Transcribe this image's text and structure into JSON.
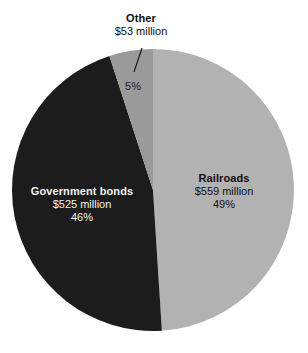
{
  "chart_data": {
    "type": "pie",
    "title": "",
    "subtitle": "",
    "xlabel": "",
    "ylabel": "",
    "legend_position": "none",
    "grid": false,
    "units": "million dollars",
    "total_value": 1137,
    "categories": [
      "Railroads",
      "Government bonds",
      "Other"
    ],
    "values": [
      559,
      525,
      53
    ],
    "percents": [
      49,
      46,
      5
    ],
    "slices": [
      {
        "name": "Railroads",
        "label": "Railroads",
        "value": 559,
        "value_text": "$559 million",
        "percent": 49,
        "percent_text": "49%",
        "color": "#b2b2b2",
        "text_color": "#101010",
        "label_placement": "inside"
      },
      {
        "name": "Government bonds",
        "label": "Government bonds",
        "value": 525,
        "value_text": "$525 million",
        "percent": 46,
        "percent_text": "46%",
        "color": "#1c1c1c",
        "text_color": "#f2f2f2",
        "label_placement": "inside"
      },
      {
        "name": "Other",
        "label": "Other",
        "value": 53,
        "value_text": "$53 million",
        "percent": 5,
        "percent_text": "5%",
        "color": "#9a9a9a",
        "text_color": "#0d0d0d",
        "label_placement": "outside-callout"
      }
    ]
  },
  "colors": {
    "railroads": "#b2b2b2",
    "government_bonds": "#1c1c1c",
    "other": "#9a9a9a",
    "background": "#ffffff",
    "leader_line": "#1a1a1a"
  }
}
